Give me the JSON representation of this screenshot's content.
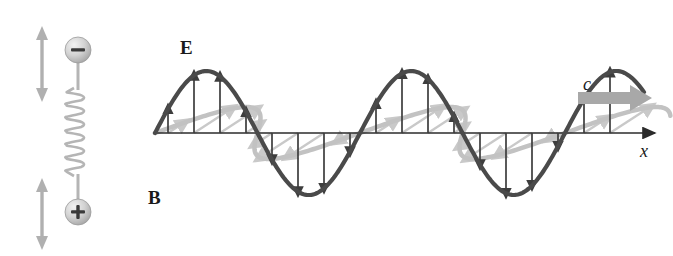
{
  "figure": {
    "kind": "electromagnetic-wave-diagram",
    "background_color": "#ffffff",
    "width": 673,
    "height": 256
  },
  "labels": {
    "e_field": "E",
    "b_field": "B",
    "speed_of_light": "c",
    "x_axis": "x",
    "negative_charge": "−",
    "positive_charge": "+"
  },
  "colors": {
    "e_wave": "#4a4a4a",
    "b_wave": "#c2c2c2",
    "axis": "#2b2b2b",
    "arrow_e": "#3d3d3d",
    "arrow_b": "#c9c9c9",
    "antenna": "#b5b5b5",
    "sphere": "#cfcfcf",
    "sphere_edge": "#9a9a9a",
    "oscillation_arrow": "#b0b0b0",
    "c_arrow": "#a8a8a8",
    "text": "#1a1a1a"
  },
  "axis": {
    "name": "x",
    "x_start": 155,
    "x_end": 655,
    "y": 133,
    "arrowhead": "right"
  },
  "antenna": {
    "name": "oscillating-dipole-antenna",
    "center_x": 78,
    "coil_turns": 6,
    "coil_top_y": 92,
    "coil_bottom_y": 172,
    "negative_sphere": {
      "cx": 78,
      "cy": 50,
      "r": 13,
      "symbol": "−"
    },
    "positive_sphere": {
      "cx": 78,
      "cy": 212,
      "r": 13,
      "symbol": "+"
    },
    "oscillation_arrows": [
      {
        "x": 42,
        "y_top": 28,
        "y_bottom": 100,
        "double_headed": true
      },
      {
        "x": 42,
        "y_top": 178,
        "y_bottom": 248,
        "double_headed": true
      }
    ]
  },
  "chart_data": {
    "type": "line",
    "title": "",
    "xlabel": "x",
    "ylabel": "",
    "series": [
      {
        "name": "E",
        "label": "E",
        "description": "electric field, transverse sinusoid in the vertical plane",
        "color": "#4a4a4a",
        "amplitude": 62,
        "wavelength": 205,
        "cycles": 2.4,
        "phase": 0,
        "x_start": 155,
        "x_end": 645,
        "baseline_y": 133
      },
      {
        "name": "B",
        "label": "B",
        "description": "magnetic field, transverse sinusoid in the horizontal plane shown in perspective, in phase with E",
        "color": "#c2c2c2",
        "amplitude": 48,
        "wavelength": 205,
        "cycles": 2.4,
        "phase": 0,
        "skew_x": 40,
        "skew_y": 26,
        "x_start": 155,
        "x_end": 645,
        "baseline_y": 133
      }
    ],
    "field_vectors": {
      "count_per_series": 18,
      "spacing": 26,
      "first_x": 168
    },
    "propagation": {
      "label": "c",
      "direction": "+x",
      "arrow_x_start": 578,
      "arrow_x_end": 650,
      "arrow_y": 98
    }
  }
}
